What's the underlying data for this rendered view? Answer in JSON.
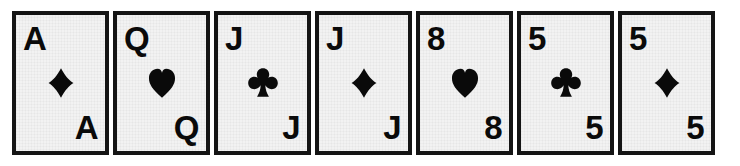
{
  "scene": {
    "title": "Row of seven playing cards",
    "background_color": "#ffffff",
    "card_face_color": "#f2f2f2",
    "card_border_color": "#141414",
    "ink_color": "#0a0a0a",
    "card_count": 7
  },
  "cards": [
    {
      "rank": "A",
      "rank_bottom": "A",
      "suit_name": "diamond-icon",
      "suit_symbol": "♦",
      "suit_color": "#0a0a0a",
      "label": "Ace of Diamonds"
    },
    {
      "rank": "Q",
      "rank_bottom": "Q",
      "suit_name": "heart-icon",
      "suit_symbol": "♥",
      "suit_color": "#0a0a0a",
      "label": "Queen of Hearts"
    },
    {
      "rank": "J",
      "rank_bottom": "J",
      "suit_name": "club-icon",
      "suit_symbol": "♣",
      "suit_color": "#0a0a0a",
      "label": "Jack of Clubs"
    },
    {
      "rank": "J",
      "rank_bottom": "J",
      "suit_name": "diamond-icon",
      "suit_symbol": "♦",
      "suit_color": "#0a0a0a",
      "label": "Jack of Diamonds"
    },
    {
      "rank": "8",
      "rank_bottom": "8",
      "suit_name": "heart-icon",
      "suit_symbol": "♥",
      "suit_color": "#0a0a0a",
      "label": "Eight of Hearts"
    },
    {
      "rank": "5",
      "rank_bottom": "5",
      "suit_name": "club-icon",
      "suit_symbol": "♣",
      "suit_color": "#0a0a0a",
      "label": "Five of Clubs"
    },
    {
      "rank": "5",
      "rank_bottom": "5",
      "suit_name": "diamond-icon",
      "suit_symbol": "♦",
      "suit_color": "#0a0a0a",
      "label": "Five of Diamonds"
    }
  ]
}
